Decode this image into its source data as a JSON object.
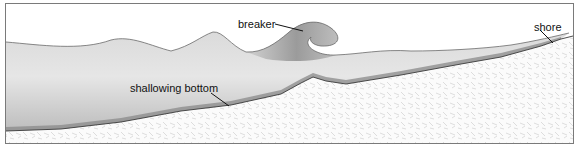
{
  "diagram": {
    "labels": {
      "breaker": "breaker",
      "shore": "shore",
      "bottom": "shallowing bottom"
    },
    "colors": {
      "water_light": "#e2e2e2",
      "water_dark": "#8e8e8e",
      "sand": "#f7f7f7",
      "outline": "#3a3a3a",
      "border": "#7a7a7a"
    }
  }
}
